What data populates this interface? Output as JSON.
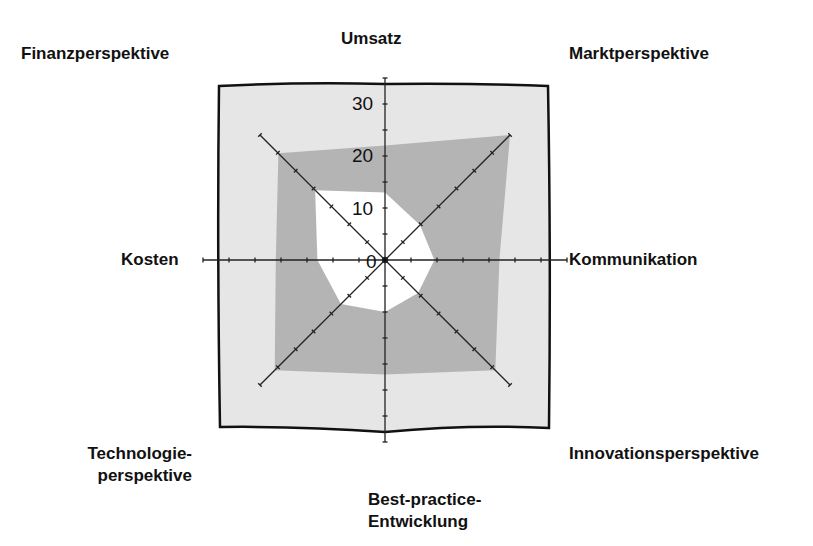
{
  "chart_data": {
    "type": "radar",
    "title": "",
    "axes": [
      "Umsatz",
      "Marktperspektive",
      "Kommunikation",
      "Innovationsperspektive",
      "Best-practice-Entwicklung",
      "Technologieperspektive",
      "Kosten",
      "Finanzperspektive"
    ],
    "radial_ticks": [
      "0",
      "10",
      "20",
      "30"
    ],
    "radial_range": [
      0,
      35
    ],
    "series": [
      {
        "name": "outer",
        "color": "#b4b4b4",
        "values": [
          22,
          34,
          22,
          30,
          22,
          30,
          21,
          29
        ]
      },
      {
        "name": "inner",
        "color": "#ffffff",
        "values": [
          13,
          9.5,
          9.5,
          9,
          10,
          12,
          13,
          19
        ]
      }
    ],
    "background_color": "#e6e6e6",
    "legend": "none",
    "grid": false
  },
  "labels": {
    "top": "Umsatz",
    "top_right": "Marktperspektive",
    "right": "Kommunikation",
    "bottom_right": "Innovationsperspektive",
    "bottom_line1": "Best-practice-",
    "bottom_line2": "Entwicklung",
    "bottom_left_line1": "Technologie-",
    "bottom_left_line2": "perspektive",
    "left": "Kosten",
    "top_left": "Finanzperspektive"
  },
  "ticks": {
    "t0": "0",
    "t10": "10",
    "t20": "20",
    "t30": "30"
  }
}
